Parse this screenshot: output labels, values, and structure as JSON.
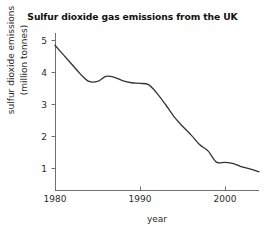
{
  "chart_data": {
    "type": "line",
    "title": "Sulfur dioxide gas emissions from the UK",
    "xlabel": "year",
    "ylabel_line1": "sulfur dioxide emissions",
    "ylabel_line2": "(million tonnes)",
    "ylabel": "sulfur dioxide emissions (million tonnes)",
    "xlim": [
      1980,
      2004
    ],
    "ylim": [
      0,
      5.35
    ],
    "xticks": [
      1980,
      1990,
      2000
    ],
    "xtick_labels": [
      "1980",
      "1990",
      "2000"
    ],
    "yticks": [
      1,
      2,
      3,
      4,
      5
    ],
    "ytick_labels": [
      "1",
      "2",
      "3",
      "4",
      "5"
    ],
    "grid": false,
    "legend": false,
    "line_color": "#333333",
    "background_color": "#ffffff",
    "axis_color": "#666666",
    "series": [
      {
        "name": "sulfur dioxide emissions",
        "x": [
          1980,
          1981,
          1982,
          1983,
          1984,
          1985,
          1986,
          1987,
          1988,
          1989,
          1990,
          1991,
          1992,
          1993,
          1994,
          1995,
          1996,
          1997,
          1998,
          1999,
          2000,
          2001,
          2002,
          2003,
          2004
        ],
        "values": [
          4.85,
          4.55,
          4.25,
          3.95,
          3.72,
          3.72,
          3.88,
          3.85,
          3.74,
          3.68,
          3.66,
          3.62,
          3.35,
          3.0,
          2.62,
          2.32,
          2.05,
          1.75,
          1.55,
          1.2,
          1.19,
          1.15,
          1.05,
          0.98,
          0.9
        ]
      }
    ]
  }
}
